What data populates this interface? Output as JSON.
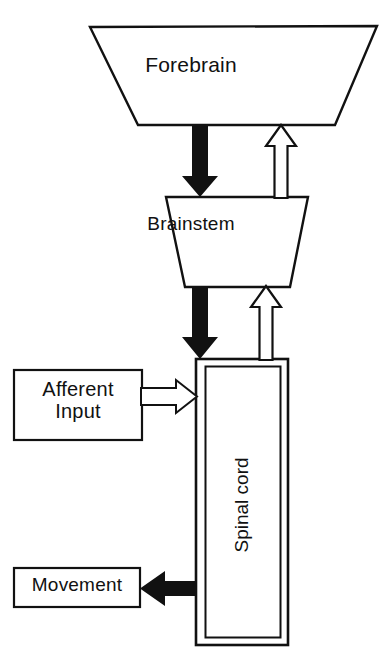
{
  "diagram": {
    "type": "flow-diagram",
    "background_color": "#ffffff",
    "line_color": "#111111",
    "nodes": [
      {
        "id": "forebrain",
        "label": "Forebrain",
        "shape": "trapezoid",
        "description": "Wide trapezoid at top, narrowing downward"
      },
      {
        "id": "brainstem",
        "label": "Brainstem",
        "shape": "trapezoid",
        "description": "Middle trapezoid, narrowing downward"
      },
      {
        "id": "spinal-cord",
        "label": "Spinal cord",
        "shape": "double-rectangle",
        "orientation": "vertical",
        "text_rotation": "-90deg"
      },
      {
        "id": "afferent-input",
        "label": "Afferent\nInput",
        "label_line1": "Afferent",
        "label_line2": "Input",
        "shape": "rectangle"
      },
      {
        "id": "movement",
        "label": "Movement",
        "shape": "rectangle"
      }
    ],
    "connectors": [
      {
        "id": "forebrain-to-brainstem",
        "from": "forebrain",
        "to": "brainstem",
        "style": "solid-filled",
        "direction": "down",
        "meaning": "descending motor command"
      },
      {
        "id": "brainstem-to-forebrain",
        "from": "brainstem",
        "to": "forebrain",
        "style": "hollow-outline",
        "direction": "up",
        "meaning": "ascending sensory feedback"
      },
      {
        "id": "brainstem-to-spinal-cord",
        "from": "brainstem",
        "to": "spinal-cord",
        "style": "solid-filled",
        "direction": "down",
        "meaning": "descending motor command"
      },
      {
        "id": "spinal-cord-to-brainstem",
        "from": "spinal-cord",
        "to": "brainstem",
        "style": "hollow-outline",
        "direction": "up",
        "meaning": "ascending sensory feedback"
      },
      {
        "id": "afferent-input-to-spinal-cord",
        "from": "afferent-input",
        "to": "spinal-cord",
        "style": "hollow-outline",
        "direction": "right",
        "meaning": "sensory afferent input"
      },
      {
        "id": "spinal-cord-to-movement",
        "from": "spinal-cord",
        "to": "movement",
        "style": "solid-filled",
        "direction": "left",
        "meaning": "motor output producing movement"
      }
    ]
  }
}
